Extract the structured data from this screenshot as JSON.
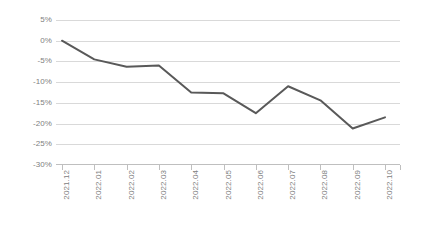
{
  "chart_data": {
    "type": "line",
    "title": "",
    "xlabel": "",
    "ylabel": "",
    "categories": [
      "2021.12",
      "2022.01",
      "2022.02",
      "2022.03",
      "2022.04",
      "2022.05",
      "2022.06",
      "2022.07",
      "2022.08",
      "2022.09",
      "2022.10"
    ],
    "values": [
      0,
      -4.5,
      -6.3,
      -6.0,
      -12.5,
      -12.7,
      -17.5,
      -11.0,
      -14.4,
      -21.2,
      -18.5
    ],
    "series": [
      {
        "name": "",
        "values": [
          0,
          -4.5,
          -6.3,
          -6.0,
          -12.5,
          -12.7,
          -17.5,
          -11.0,
          -14.4,
          -21.2,
          -18.5
        ]
      }
    ],
    "ylim": [
      -30,
      5
    ],
    "y_ticks": [
      5,
      0,
      -5,
      -10,
      -15,
      -20,
      -25,
      -30
    ],
    "y_tick_labels": [
      "5%",
      "0%",
      "-5%",
      "-10%",
      "-15%",
      "-20%",
      "-25%",
      "-30%"
    ],
    "grid": true,
    "legend": "none",
    "line_color": "#595959",
    "gridline_color": "#d9d9d9",
    "axis_color": "#bfbfbf",
    "label_color": "#808080"
  }
}
